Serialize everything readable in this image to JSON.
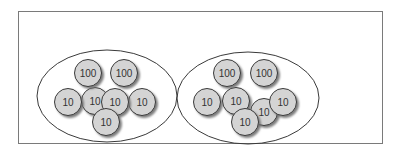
{
  "diagram": {
    "colors": {
      "frame": "#7a7a7a",
      "ellipse_stroke": "#3a3a3a",
      "coin_fill": "#d4d4d4",
      "coin_stroke": "#3a3a3a",
      "coin_shadow": "#6e6e6e",
      "coin_text": "#333333"
    },
    "groups": [
      {
        "name": "group-left",
        "ellipse": {
          "cx": 107,
          "cy": 96,
          "rx": 70,
          "ry": 46
        },
        "coins": [
          {
            "label": "10",
            "cx": 95,
            "cy": 101
          },
          {
            "label": "100",
            "cx": 88,
            "cy": 73
          },
          {
            "label": "100",
            "cx": 124,
            "cy": 73
          },
          {
            "label": "10",
            "cx": 68,
            "cy": 102
          },
          {
            "label": "10",
            "cx": 142,
            "cy": 102
          },
          {
            "label": "10",
            "cx": 115,
            "cy": 102
          },
          {
            "label": "10",
            "cx": 106,
            "cy": 122
          }
        ]
      },
      {
        "name": "group-right",
        "ellipse": {
          "cx": 248,
          "cy": 98,
          "rx": 71,
          "ry": 46
        },
        "coins": [
          {
            "label": "100",
            "cx": 227,
            "cy": 73
          },
          {
            "label": "100",
            "cx": 264,
            "cy": 73
          },
          {
            "label": "10",
            "cx": 207,
            "cy": 102
          },
          {
            "label": "10",
            "cx": 236,
            "cy": 101
          },
          {
            "label": "10",
            "cx": 264,
            "cy": 112
          },
          {
            "label": "10",
            "cx": 283,
            "cy": 102
          },
          {
            "label": "10",
            "cx": 245,
            "cy": 122
          }
        ]
      }
    ]
  }
}
